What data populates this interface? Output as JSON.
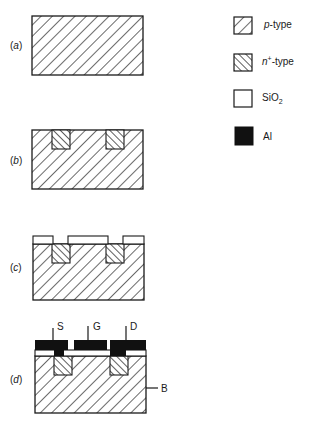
{
  "figure": {
    "steps": [
      {
        "label": "(a)",
        "letter": "a"
      },
      {
        "label": "(b)",
        "letter": "b"
      },
      {
        "label": "(c)",
        "letter": "c"
      },
      {
        "label": "(d)",
        "letter": "d"
      }
    ],
    "legend": [
      {
        "key": "p-type",
        "italic_prefix": "p",
        "text": "-type",
        "pattern": "hatch-forward"
      },
      {
        "key": "n+-type",
        "italic_prefix": "n",
        "sup": "+",
        "text": "-type",
        "pattern": "hatch-backward"
      },
      {
        "key": "SiO2",
        "text": "SiO",
        "sub": "2",
        "pattern": "white"
      },
      {
        "key": "Al",
        "text": "Al",
        "pattern": "black"
      }
    ],
    "terminals": {
      "source": "S",
      "gate": "G",
      "drain": "D",
      "body": "B"
    },
    "colors": {
      "ink": "#1a1a1a",
      "background": "#ffffff"
    }
  }
}
